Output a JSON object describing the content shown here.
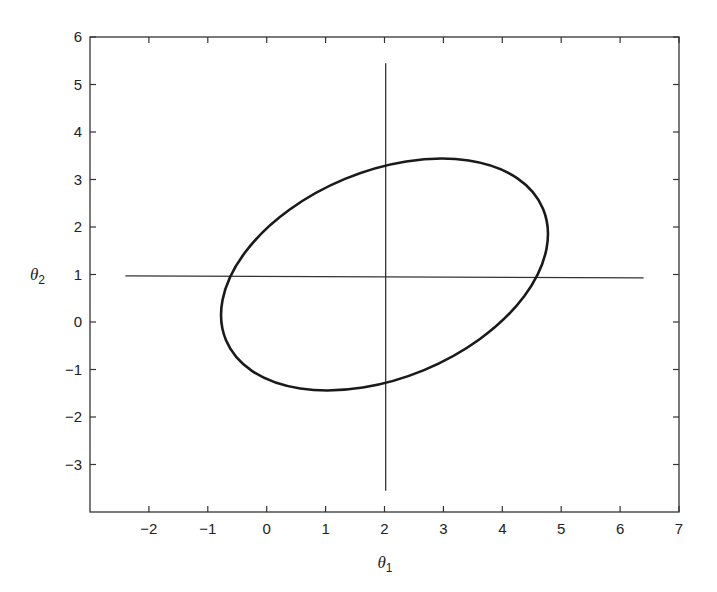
{
  "chart_data": {
    "type": "line",
    "title": "",
    "xlabel": "θ1",
    "ylabel": "θ2",
    "xlim": [
      -3,
      7
    ],
    "ylim": [
      -4,
      6
    ],
    "xticks": [
      -2,
      -1,
      0,
      1,
      2,
      3,
      4,
      5,
      6,
      7
    ],
    "yticks": [
      -3,
      -2,
      -1,
      0,
      1,
      2,
      3,
      4,
      5,
      6
    ],
    "grid": false,
    "legend": null,
    "series": [
      {
        "name": "confidence-ellipse",
        "kind": "ellipse",
        "center": [
          2.0,
          1.0
        ],
        "extent_x": [
          -0.77,
          4.78
        ],
        "extent_y": [
          -1.45,
          3.43
        ],
        "top_point": [
          3.07,
          3.43
        ],
        "bottom_point": [
          0.97,
          -1.45
        ],
        "left_point": [
          -0.77,
          0.05
        ],
        "right_point": [
          4.78,
          1.9
        ],
        "crosses_vertical_line_at_theta2": [
          -1.26,
          3.26
        ],
        "crosses_horizontal_line_at_theta1": [
          -0.6,
          4.6
        ],
        "color": "#1a1a1a"
      },
      {
        "name": "horizontal-line",
        "kind": "segment",
        "x": [
          -2.4,
          6.4
        ],
        "y": [
          0.97,
          0.93
        ],
        "color": "#333333"
      },
      {
        "name": "vertical-line",
        "kind": "segment",
        "x": [
          2.02,
          2.02
        ],
        "y": [
          -3.55,
          5.45
        ],
        "color": "#333333"
      }
    ]
  },
  "axes": {
    "x_label_main": "θ",
    "x_label_sub": "1",
    "y_label_main": "θ",
    "y_label_sub": "2",
    "x_tick_labels": [
      "−2",
      "−1",
      "0",
      "1",
      "2",
      "3",
      "4",
      "5",
      "6",
      "7"
    ],
    "y_tick_labels": [
      "−3",
      "−2",
      "−1",
      "0",
      "1",
      "2",
      "3",
      "4",
      "5",
      "6"
    ]
  }
}
